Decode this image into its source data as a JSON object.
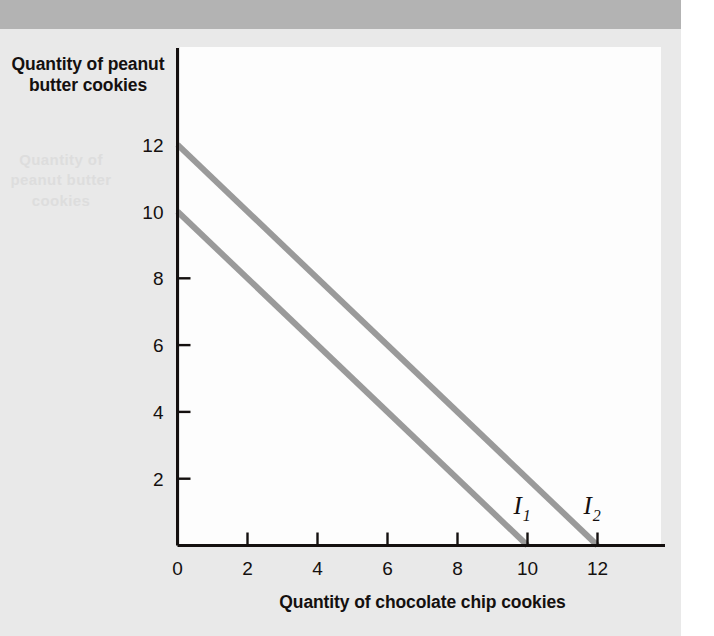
{
  "figure": {
    "background_color": "#e9e9e9",
    "panel_color": "#fdfdfd",
    "banner_color": "#b3b3b3",
    "axis_color": "#14100f",
    "curve_color": "#9a9a9a",
    "ghost_text": "Quantity of peanut butter cookies"
  },
  "chart_data": {
    "type": "line",
    "title": "",
    "xlabel": "Quantity of chocolate chip cookies",
    "ylabel": "Quantity of peanut butter cookies",
    "xlim": [
      0,
      13.5
    ],
    "ylim": [
      0,
      13.8
    ],
    "xticks": [
      0,
      2,
      4,
      6,
      8,
      10,
      12
    ],
    "xticklabels": [
      "0",
      "2",
      "4",
      "6",
      "8",
      "10",
      "12"
    ],
    "yticks": [
      2,
      4,
      6,
      8,
      10,
      12
    ],
    "yticklabels": [
      "2",
      "4",
      "6",
      "8",
      "10",
      "12"
    ],
    "grid": false,
    "legend": "none",
    "series": [
      {
        "name": "I1",
        "label": "I",
        "subscript": "1",
        "color": "#9a9a9a",
        "x": [
          0,
          10
        ],
        "y": [
          10,
          0
        ],
        "intercept_x": 10,
        "intercept_y": 10,
        "label_x": 9.6,
        "label_y": 0.95
      },
      {
        "name": "I2",
        "label": "I",
        "subscript": "2",
        "color": "#9a9a9a",
        "x": [
          0,
          12
        ],
        "y": [
          12,
          0
        ],
        "intercept_x": 12,
        "intercept_y": 12,
        "label_x": 11.6,
        "label_y": 0.95
      }
    ]
  }
}
